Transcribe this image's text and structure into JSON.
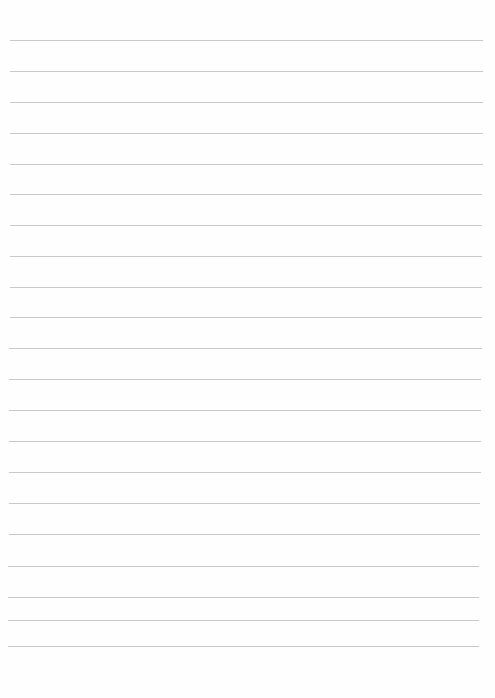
{
  "page": {
    "type": "lined-paper",
    "background_color": "#fefefe",
    "line_color": "#c9c9c9",
    "line_count": 21,
    "lines": [
      {
        "y": 40,
        "x1": 10,
        "x2": 483
      },
      {
        "y": 71,
        "x1": 10,
        "x2": 483
      },
      {
        "y": 102,
        "x1": 10,
        "x2": 483
      },
      {
        "y": 133,
        "x1": 10,
        "x2": 483
      },
      {
        "y": 164,
        "x1": 10,
        "x2": 483
      },
      {
        "y": 194,
        "x1": 10,
        "x2": 482
      },
      {
        "y": 225,
        "x1": 10,
        "x2": 482
      },
      {
        "y": 256,
        "x1": 10,
        "x2": 482
      },
      {
        "y": 287,
        "x1": 10,
        "x2": 482
      },
      {
        "y": 317,
        "x1": 10,
        "x2": 482
      },
      {
        "y": 348,
        "x1": 9,
        "x2": 482
      },
      {
        "y": 379,
        "x1": 9,
        "x2": 481
      },
      {
        "y": 410,
        "x1": 9,
        "x2": 481
      },
      {
        "y": 441,
        "x1": 9,
        "x2": 481
      },
      {
        "y": 472,
        "x1": 9,
        "x2": 481
      },
      {
        "y": 503,
        "x1": 9,
        "x2": 480
      },
      {
        "y": 534,
        "x1": 9,
        "x2": 480
      },
      {
        "y": 566,
        "x1": 8,
        "x2": 479
      },
      {
        "y": 597,
        "x1": 8,
        "x2": 479
      },
      {
        "y": 620,
        "x1": 8,
        "x2": 479
      },
      {
        "y": 646,
        "x1": 8,
        "x2": 479
      }
    ]
  }
}
